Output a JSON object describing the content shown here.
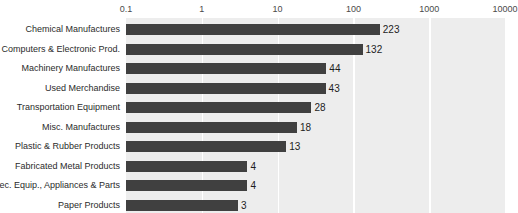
{
  "chart_data": {
    "type": "bar",
    "orientation": "horizontal",
    "title": "",
    "subtitle": "",
    "xlabel": "",
    "ylabel": "",
    "xscale": "log",
    "xlim": [
      0.1,
      10000
    ],
    "grid": true,
    "legend": null,
    "legend_position": "none",
    "categories": [
      "Chemical Manufactures",
      "Computers & Electronic Prod.",
      "Machinery Manufactures",
      "Used Merchandise",
      "Transportation Equipment",
      "Misc. Manufactures",
      "Plastic & Rubber Products",
      "Fabricated Metal Products",
      "Elec. Equip., Appliances & Parts",
      "Paper Products"
    ],
    "values": [
      223,
      132,
      44,
      43,
      28,
      18,
      13,
      4,
      4,
      3
    ],
    "data_labels": [
      "223",
      "132",
      "44",
      "43",
      "28",
      "18",
      "13",
      "4",
      "4",
      "3"
    ],
    "xticks": [
      0.1,
      1,
      10,
      100,
      1000,
      10000
    ],
    "xtick_labels": [
      "0.1",
      "1",
      "10",
      "100",
      "1000",
      "10000"
    ],
    "colors": {
      "bar": "#404040",
      "plot_background": "#ededed",
      "gridline": "#ffffff",
      "axis_text": "#4a4a4a",
      "category_text": "#2b2b2b",
      "value_text": "#1d1d1d",
      "page_background": "#ffffff"
    }
  }
}
